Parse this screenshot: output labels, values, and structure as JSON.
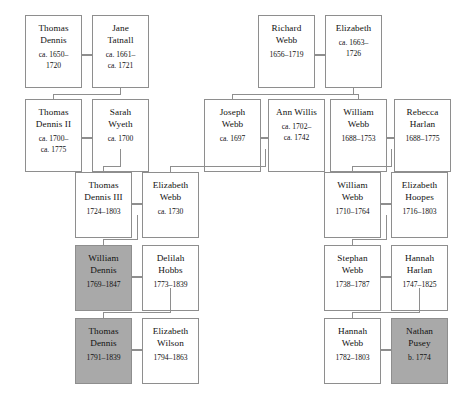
{
  "diagram": {
    "colors": {
      "line": "#8e8e8e",
      "box_border": "#8e8e8e",
      "box_fill": "#ffffff",
      "highlight_fill": "#a9a9a9",
      "text": "#111111"
    },
    "legend_note": "Shaded boxes mark highlighted individuals"
  },
  "nodes": [
    {
      "id": "thomas-dennis-i",
      "name_line1": "Thomas",
      "name_line2": "Dennis",
      "dates_line1": "ca. 1650–",
      "dates_line2": "1720",
      "shaded": false
    },
    {
      "id": "jane-tatnall",
      "name_line1": "Jane",
      "name_line2": "Tatnall",
      "dates_line1": "ca. 1661–",
      "dates_line2": "ca. 1721",
      "shaded": false
    },
    {
      "id": "richard-webb",
      "name_line1": "Richard",
      "name_line2": "Webb",
      "dates_line1": "1656–1719",
      "dates_line2": "",
      "shaded": false
    },
    {
      "id": "elizabeth",
      "name_line1": "Elizabeth",
      "name_line2": "",
      "dates_line1": "ca. 1663–",
      "dates_line2": "1726",
      "shaded": false
    },
    {
      "id": "thomas-dennis-ii",
      "name_line1": "Thomas",
      "name_line2": "Dennis II",
      "dates_line1": "ca. 1700–",
      "dates_line2": "ca. 1775",
      "shaded": false
    },
    {
      "id": "sarah-wyeth",
      "name_line1": "Sarah",
      "name_line2": "Wyeth",
      "dates_line1": "ca. 1700",
      "dates_line2": "",
      "shaded": false
    },
    {
      "id": "joseph-webb",
      "name_line1": "Joseph",
      "name_line2": "Webb",
      "dates_line1": "ca. 1697",
      "dates_line2": "",
      "shaded": false
    },
    {
      "id": "ann-willis",
      "name_line1": "Ann Willis",
      "name_line2": "",
      "dates_line1": "ca. 1702–",
      "dates_line2": "ca. 1742",
      "shaded": false
    },
    {
      "id": "william-webb-1688",
      "name_line1": "William",
      "name_line2": "Webb",
      "dates_line1": "1688–1753",
      "dates_line2": "",
      "shaded": false
    },
    {
      "id": "rebecca-harlan",
      "name_line1": "Rebecca",
      "name_line2": "Harlan",
      "dates_line1": "1688–1775",
      "dates_line2": "",
      "shaded": false
    },
    {
      "id": "thomas-dennis-iii",
      "name_line1": "Thomas",
      "name_line2": "Dennis III",
      "dates_line1": "1724–1803",
      "dates_line2": "",
      "shaded": false
    },
    {
      "id": "elizabeth-webb",
      "name_line1": "Elizabeth",
      "name_line2": "Webb",
      "dates_line1": "ca. 1730",
      "dates_line2": "",
      "shaded": false
    },
    {
      "id": "william-webb-1710",
      "name_line1": "William",
      "name_line2": "Webb",
      "dates_line1": "1710–1764",
      "dates_line2": "",
      "shaded": false
    },
    {
      "id": "elizabeth-hoopes",
      "name_line1": "Elizabeth",
      "name_line2": "Hoopes",
      "dates_line1": "1716–1803",
      "dates_line2": "",
      "shaded": false
    },
    {
      "id": "william-dennis",
      "name_line1": "William",
      "name_line2": "Dennis",
      "dates_line1": "1769–1847",
      "dates_line2": "",
      "shaded": true
    },
    {
      "id": "delilah-hobbs",
      "name_line1": "Delilah",
      "name_line2": "Hobbs",
      "dates_line1": "1773–1839",
      "dates_line2": "",
      "shaded": false
    },
    {
      "id": "stephan-webb",
      "name_line1": "Stephan",
      "name_line2": "Webb",
      "dates_line1": "1738–1787",
      "dates_line2": "",
      "shaded": false
    },
    {
      "id": "hannah-harlan",
      "name_line1": "Hannah",
      "name_line2": "Harlan",
      "dates_line1": "1747–1825",
      "dates_line2": "",
      "shaded": false
    },
    {
      "id": "thomas-dennis-1791",
      "name_line1": "Thomas",
      "name_line2": "Dennis",
      "dates_line1": "1791–1839",
      "dates_line2": "",
      "shaded": true
    },
    {
      "id": "elizabeth-wilson",
      "name_line1": "Elizabeth",
      "name_line2": "Wilson",
      "dates_line1": "1794–1863",
      "dates_line2": "",
      "shaded": false
    },
    {
      "id": "hannah-webb",
      "name_line1": "Hannah",
      "name_line2": "Webb",
      "dates_line1": "1782–1803",
      "dates_line2": "",
      "shaded": false
    },
    {
      "id": "nathan-pusey",
      "name_line1": "Nathan",
      "name_line2": "Pusey",
      "dates_line1": "b. 1774",
      "dates_line2": "",
      "shaded": true
    }
  ]
}
